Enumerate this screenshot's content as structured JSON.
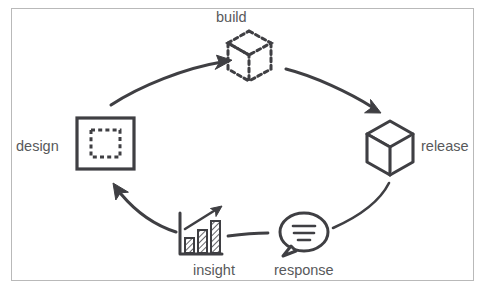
{
  "diagram": {
    "type": "cycle-diagram",
    "stroke_color": "#3f3f43",
    "label_color": "#58595b",
    "frame_color": "#b9b9b9",
    "background": "#ffffff",
    "nodes": [
      {
        "id": "design",
        "label": "design",
        "icon": "square-with-dashed-inner-square-icon",
        "label_position": "left"
      },
      {
        "id": "build",
        "label": "build",
        "icon": "dashed-cube-icon",
        "label_position": "top"
      },
      {
        "id": "release",
        "label": "release",
        "icon": "solid-cube-icon",
        "label_position": "right"
      },
      {
        "id": "response",
        "label": "response",
        "icon": "speech-bubble-icon",
        "label_position": "bottom"
      },
      {
        "id": "insight",
        "label": "insight",
        "icon": "bar-chart-trend-up-icon",
        "label_position": "bottom"
      }
    ],
    "edges": [
      {
        "from": "design",
        "to": "build",
        "arrowhead": true
      },
      {
        "from": "build",
        "to": "release",
        "arrowhead": true
      },
      {
        "from": "release",
        "to": "response",
        "arrowhead": false
      },
      {
        "from": "response",
        "to": "insight",
        "arrowhead": false
      },
      {
        "from": "insight",
        "to": "design",
        "arrowhead": true
      }
    ]
  }
}
